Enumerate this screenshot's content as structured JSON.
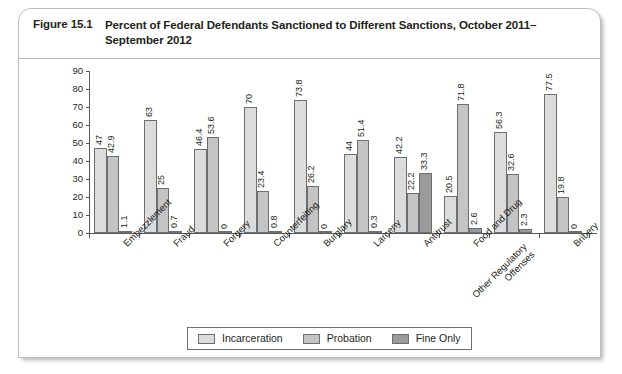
{
  "figure": {
    "number": "Figure 15.1",
    "title": "Percent of Federal Defendants Sanctioned to Different Sanctions, October 2011–September 2012"
  },
  "chart_data": {
    "type": "bar",
    "title": "Percent of Federal Defendants Sanctioned to Different Sanctions, October 2011–September 2012",
    "xlabel": "",
    "ylabel": "",
    "ylim": [
      0,
      90
    ],
    "yticks": [
      0,
      10,
      20,
      30,
      40,
      50,
      60,
      70,
      80,
      90
    ],
    "grid": false,
    "legend_position": "bottom",
    "categories": [
      "Embezzlement",
      "Fraud",
      "Forgery",
      "Counterfeiting",
      "Burglary",
      "Larceny",
      "Antitrust",
      "Food and Drug",
      "Other Regulatory Offenses",
      "Bribery"
    ],
    "series": [
      {
        "name": "Incarceration",
        "color": "#dcdcdc",
        "values": [
          47,
          63,
          46.4,
          70,
          73.8,
          44,
          42.2,
          20.5,
          56.3,
          77.5
        ],
        "labels": [
          "47",
          "63",
          "46.4",
          "70",
          "73.8",
          "44",
          "42.2",
          "20.5",
          "56.3",
          "77.5"
        ]
      },
      {
        "name": "Probation",
        "color": "#c4c4c4",
        "values": [
          42.9,
          25,
          53.6,
          23.4,
          26.2,
          51.4,
          22.2,
          71.8,
          32.6,
          19.8
        ],
        "labels": [
          "42.9",
          "25",
          "53.6",
          "23.4",
          "26.2",
          "51.4",
          "22.2",
          "71.8",
          "32.6",
          "19.8"
        ]
      },
      {
        "name": "Fine Only",
        "color": "#9a9a9a",
        "values": [
          1.1,
          0.7,
          0,
          0.8,
          0,
          0.3,
          33.3,
          2.6,
          2.3,
          0
        ],
        "labels": [
          "1.1",
          "0.7",
          "0",
          "0.8",
          "0",
          "0.3",
          "33.3",
          "2.6",
          "2.3",
          "0"
        ]
      }
    ]
  },
  "legend": {
    "items": [
      {
        "label": "Incarceration",
        "color": "#dcdcdc"
      },
      {
        "label": "Probation",
        "color": "#c4c4c4"
      },
      {
        "label": "Fine Only",
        "color": "#9a9a9a"
      }
    ]
  }
}
